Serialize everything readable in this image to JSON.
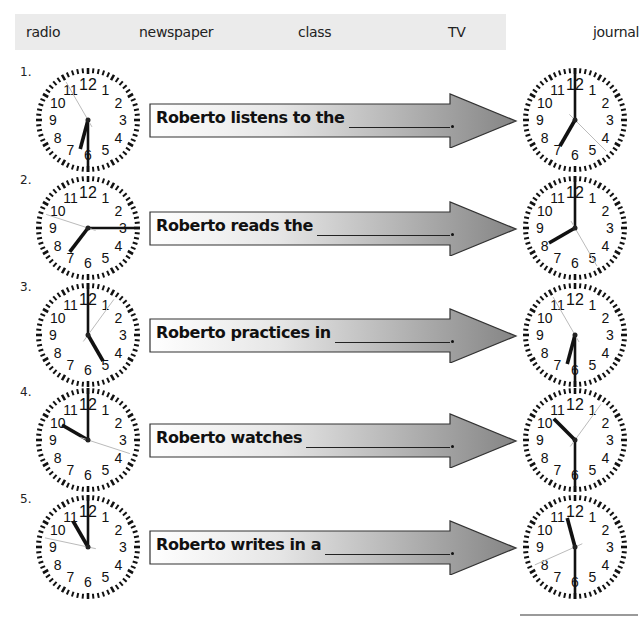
{
  "word_bank": [
    "radio",
    "newspaper",
    "class",
    "TV",
    "journal"
  ],
  "exercises": [
    {
      "number": "1.",
      "sentence": "Roberto listens to the",
      "blank_answer": "",
      "start_time": {
        "hour": 6,
        "minute": 30,
        "second_pos": 11
      },
      "end_time": {
        "hour": 7,
        "minute": 0,
        "second_pos": 4.5
      }
    },
    {
      "number": "2.",
      "sentence": "Roberto reads the",
      "blank_answer": "",
      "start_time": {
        "hour": 7,
        "minute": 15,
        "second_pos": 9.6
      },
      "end_time": {
        "hour": 8,
        "minute": 0,
        "second_pos": 5
      }
    },
    {
      "number": "3.",
      "sentence": "Roberto practices in",
      "blank_answer": "",
      "start_time": {
        "hour": 5,
        "minute": 0,
        "second_pos": 1.2
      },
      "end_time": {
        "hour": 6,
        "minute": 30,
        "second_pos": 11
      }
    },
    {
      "number": "4.",
      "sentence": "Roberto watches",
      "blank_answer": "",
      "start_time": {
        "hour": 10,
        "minute": 0,
        "second_pos": 3.6
      },
      "end_time": {
        "hour": 10,
        "minute": 30,
        "second_pos": 1.2
      }
    },
    {
      "number": "5.",
      "sentence": "Roberto writes in a",
      "blank_answer": "",
      "start_time": {
        "hour": 11,
        "minute": 0,
        "second_pos": 9.4
      },
      "end_time": {
        "hour": 11,
        "minute": 30,
        "second_pos": 8.2
      }
    }
  ],
  "colors": {
    "word_bank_bg": "#ebebeb",
    "arrow_gradient_start": "#ffffff",
    "arrow_gradient_end": "#8a8a8a",
    "arrow_stroke": "#333333",
    "hand_color": "#111111",
    "second_hand_color": "#bbbbbb"
  }
}
